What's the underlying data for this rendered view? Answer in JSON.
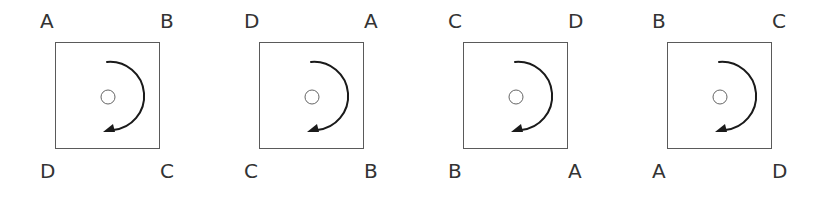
{
  "diagram": {
    "colors": {
      "square_stroke": "#5a5a5a",
      "arrow": "#1a1a1a",
      "pivot_stroke": "#666666",
      "label": "#333333",
      "background": "#ffffff"
    },
    "rotation_direction": "clockwise",
    "panels": [
      {
        "id": "panel-1",
        "labels": {
          "top_left": "A",
          "top_right": "B",
          "bottom_left": "D",
          "bottom_right": "C"
        }
      },
      {
        "id": "panel-2",
        "labels": {
          "top_left": "D",
          "top_right": "A",
          "bottom_left": "C",
          "bottom_right": "B"
        }
      },
      {
        "id": "panel-3",
        "labels": {
          "top_left": "C",
          "top_right": "D",
          "bottom_left": "B",
          "bottom_right": "A"
        }
      },
      {
        "id": "panel-4",
        "labels": {
          "top_left": "B",
          "top_right": "C",
          "bottom_left": "A",
          "bottom_right": "D"
        }
      }
    ]
  }
}
